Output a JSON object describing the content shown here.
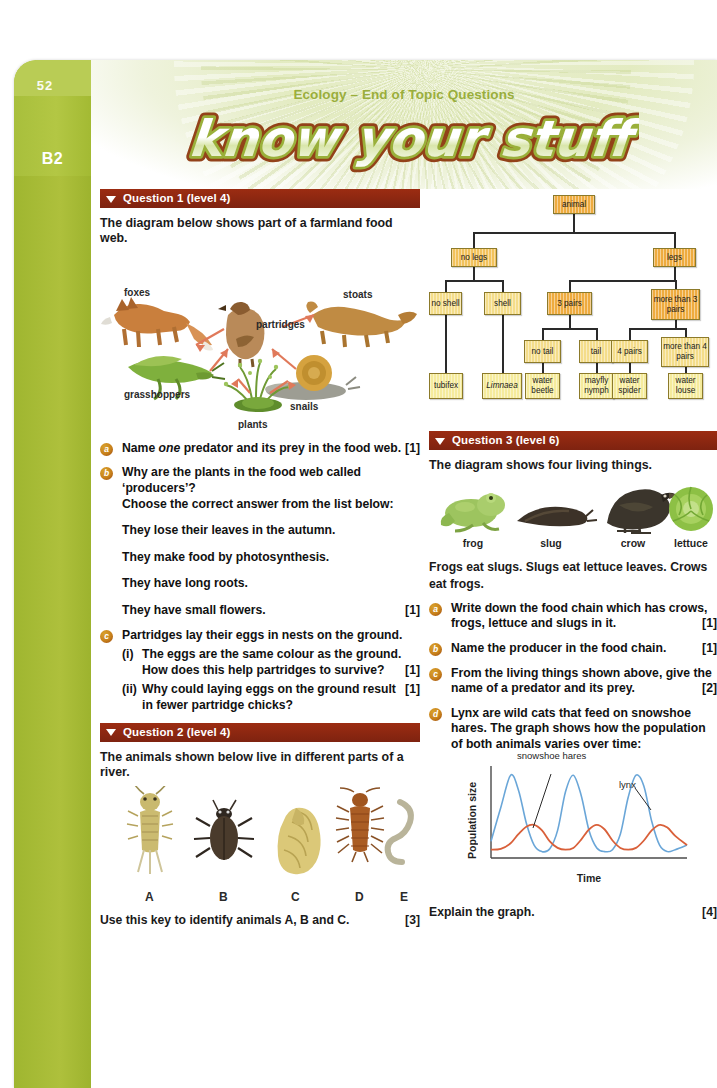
{
  "page": {
    "number": "52",
    "spine_code": "B2",
    "banner_title": "Ecology – End of Topic Questions",
    "wordmark": "know your stuff",
    "accent_green": "#a8bf3c",
    "accent_red": "#8b2711",
    "bullet_orange": "#c8811b"
  },
  "q1": {
    "header": "Question 1 (level 4)",
    "intro": "The diagram below shows part of a farmland food web.",
    "foodweb": {
      "labels": [
        "foxes",
        "stoats",
        "partridges",
        "grasshoppers",
        "snails",
        "plants"
      ]
    },
    "items": [
      {
        "letter": "a",
        "text": "Name one predator and its prey in the food web.",
        "italic_word": "one",
        "marks": "[1]"
      },
      {
        "letter": "b",
        "text": "Why are the plants in the food web called ‘producers’?",
        "text2": "Choose the correct answer from the list below:",
        "options": [
          "They lose their leaves in the autumn.",
          "They make food by photosynthesis.",
          "They have long roots.",
          "They have small flowers."
        ],
        "marks": "[1]"
      },
      {
        "letter": "c",
        "text": "Partridges lay their eggs in nests on the ground.",
        "subs": [
          {
            "num": "(i)",
            "text": "The eggs are the same colour as the ground.",
            "text2": "How does this help partridges to survive?",
            "marks": "[1]"
          },
          {
            "num": "(ii)",
            "text": "Why could laying eggs on the ground result in fewer partridge chicks?",
            "marks": "[1]"
          }
        ]
      }
    ]
  },
  "q2": {
    "header": "Question 2 (level 4)",
    "intro": "The animals shown below live in different parts of a river.",
    "specimen_labels": [
      "A",
      "B",
      "C",
      "D",
      "E"
    ],
    "closing": "Use this key to identify animals A, B and C.",
    "closing_marks": "[3]"
  },
  "key_tree": {
    "root": "animal",
    "level1": [
      "no legs",
      "legs"
    ],
    "level2": [
      "no shell",
      "shell",
      "3 pairs",
      "more than 3 pairs"
    ],
    "level3": [
      "no tail",
      "tail",
      "4 pairs",
      "more than 4 pairs"
    ],
    "leaves": [
      "tubifex",
      "Limnaea",
      "water beetle",
      "mayfly nymph",
      "water spider",
      "water louse"
    ],
    "italic_leaves": [
      "Limnaea"
    ]
  },
  "q3": {
    "header": "Question 3 (level 6)",
    "intro": "The diagram shows four living things.",
    "creatures": [
      "frog",
      "slug",
      "crow",
      "lettuce"
    ],
    "statement": "Frogs eat slugs. Slugs eat lettuce leaves. Crows eat frogs.",
    "items": [
      {
        "letter": "a",
        "text": "Write down the food chain which has crows, frogs, lettuce and slugs in it.",
        "marks": "[1]"
      },
      {
        "letter": "b",
        "text": "Name the producer in the food chain.",
        "marks": "[1]"
      },
      {
        "letter": "c",
        "text": "From the living things shown above, give the name of a predator and its prey.",
        "marks": "[2]"
      },
      {
        "letter": "d",
        "text": "Lynx are wild cats that feed on snowshoe hares. The graph shows how the population of both animals varies over time:",
        "marks": ""
      }
    ],
    "closing": "Explain the graph.",
    "closing_marks": "[4]"
  },
  "chart_data": {
    "type": "line",
    "title": "",
    "xlabel": "Time",
    "ylabel": "Population size",
    "grid": false,
    "legend": "inline-annotations",
    "annotations": [
      "snowshoe hares",
      "lynx"
    ],
    "series": [
      {
        "name": "snowshoe hares",
        "color": "#6aa6d8",
        "peaks": 3,
        "peak_value": 90,
        "trough_value": 6,
        "phase_lead": "peaks before lynx",
        "x": [
          0,
          5,
          10,
          14,
          18,
          22,
          26,
          30,
          34,
          38,
          42,
          46,
          50,
          54,
          58,
          62,
          66,
          70,
          74,
          78,
          82,
          86,
          90,
          94,
          100
        ],
        "y": [
          18,
          55,
          90,
          74,
          38,
          14,
          7,
          10,
          30,
          72,
          90,
          68,
          30,
          11,
          7,
          9,
          26,
          66,
          90,
          78,
          40,
          14,
          7,
          9,
          14
        ]
      },
      {
        "name": "lynx",
        "color": "#d9603a",
        "peaks": 3,
        "peak_value": 36,
        "trough_value": 8,
        "phase_lead": "peaks after hares",
        "x": [
          0,
          5,
          10,
          14,
          18,
          22,
          26,
          30,
          34,
          38,
          42,
          46,
          50,
          54,
          58,
          62,
          66,
          70,
          74,
          78,
          82,
          86,
          90,
          94,
          100
        ],
        "y": [
          9,
          10,
          16,
          26,
          34,
          36,
          30,
          18,
          11,
          9,
          11,
          20,
          31,
          36,
          31,
          19,
          11,
          9,
          11,
          19,
          30,
          36,
          33,
          24,
          14
        ]
      }
    ],
    "xlim": [
      0,
      100
    ],
    "ylim": [
      0,
      100
    ]
  }
}
